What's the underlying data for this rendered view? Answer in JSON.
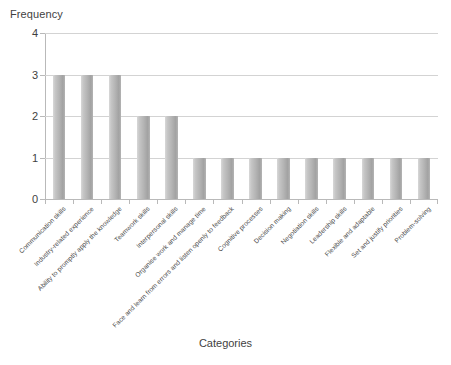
{
  "chart_data": {
    "type": "bar",
    "title": "",
    "xlabel": "Categories",
    "ylabel": "Frequency",
    "ylim": [
      0,
      4
    ],
    "yticks": [
      0,
      1,
      2,
      3,
      4
    ],
    "grid": true,
    "legend": false,
    "categories": [
      "Communication skills",
      "Industry-related experience",
      "Ability to promptly apply the knowledge",
      "Teamwork skills",
      "Interpersonal skills",
      "Organise work and manage time",
      "Face and learn from errors and listen openly to feedback",
      "Cognitive processes",
      "Decision making",
      "Negotiation skills",
      "Leadership skills",
      "Flexible and adaptable",
      "Set and justify priorities",
      "Problem-solving"
    ],
    "values": [
      3,
      3,
      3,
      2,
      2,
      1,
      1,
      1,
      1,
      1,
      1,
      1,
      1,
      1
    ],
    "bar_color": "#b2b2b2",
    "grid_color": "#d3d3d3",
    "axis_color": "#b9b9b9",
    "text_color": "#3f3f3f"
  },
  "axes": {
    "y_title": "Frequency",
    "x_title": "Categories",
    "y_tick_labels": [
      "0",
      "1",
      "2",
      "3",
      "4"
    ]
  }
}
